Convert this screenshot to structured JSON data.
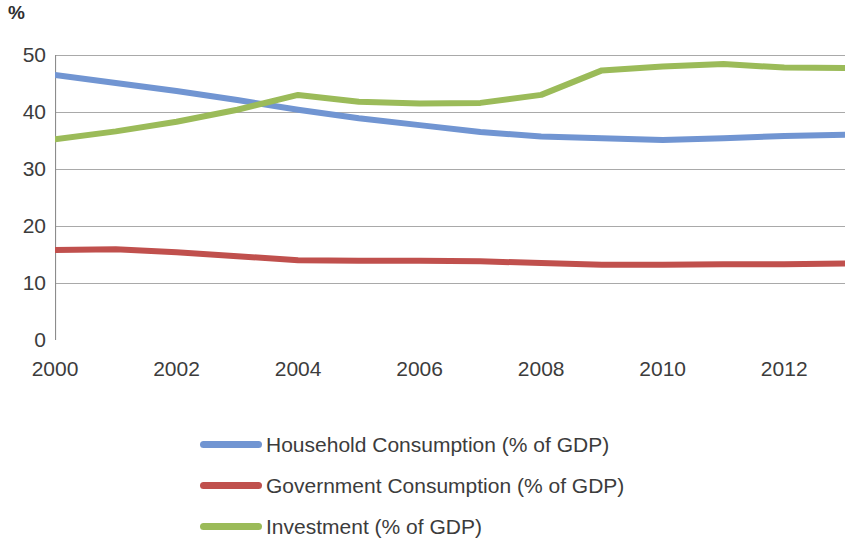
{
  "axis_unit_label": "%",
  "colors": {
    "household": "#7195D2",
    "government": "#C0504D",
    "investment": "#9BBB59",
    "gridline": "#9a9a9a",
    "axis": "#8c8c8c",
    "text": "#3c3c3c",
    "background": "#ffffff"
  },
  "legend": {
    "items": [
      {
        "label": "Household Consumption (% of GDP)",
        "color": "#7195D2",
        "key": "household"
      },
      {
        "label": "Government Consumption (% of GDP)",
        "color": "#C0504D",
        "key": "government"
      },
      {
        "label": "Investment (% of GDP)",
        "color": "#9BBB59",
        "key": "investment"
      }
    ]
  },
  "chart_data": {
    "type": "line",
    "title": "",
    "subtitle": "",
    "xlabel": "",
    "ylabel": "%",
    "xlim": [
      2000,
      2013
    ],
    "ylim": [
      0,
      50
    ],
    "ytick_labels": [
      "0",
      "10",
      "20",
      "30",
      "40",
      "50"
    ],
    "ytick_values": [
      0,
      10,
      20,
      30,
      40,
      50
    ],
    "xtick_labels": [
      "2000",
      "2002",
      "2004",
      "2006",
      "2008",
      "2010",
      "2012"
    ],
    "xtick_values": [
      2000,
      2002,
      2004,
      2006,
      2008,
      2010,
      2012
    ],
    "x_minor_ticks": [
      2000,
      2001,
      2002,
      2003,
      2004,
      2005,
      2006,
      2007,
      2008,
      2009,
      2010,
      2011,
      2012,
      2013
    ],
    "grid": "horizontal",
    "legend_position": "bottom",
    "x": [
      2000,
      2001,
      2002,
      2003,
      2004,
      2005,
      2006,
      2007,
      2008,
      2009,
      2010,
      2011,
      2012,
      2013
    ],
    "series": [
      {
        "name": "Household Consumption (% of GDP)",
        "color": "#7195D2",
        "values": [
          46.5,
          45.1,
          43.7,
          42.1,
          40.4,
          38.9,
          37.7,
          36.5,
          35.7,
          35.4,
          35.1,
          35.4,
          35.8,
          36.0
        ]
      },
      {
        "name": "Government Consumption (% of GDP)",
        "color": "#C0504D",
        "values": [
          15.8,
          15.9,
          15.4,
          14.7,
          14.0,
          13.9,
          13.9,
          13.8,
          13.5,
          13.2,
          13.2,
          13.3,
          13.3,
          13.4
        ]
      },
      {
        "name": "Investment (% of GDP)",
        "color": "#9BBB59",
        "values": [
          35.2,
          36.6,
          38.3,
          40.4,
          43.0,
          41.8,
          41.5,
          41.6,
          43.0,
          47.3,
          48.0,
          48.4,
          47.8,
          47.7
        ]
      }
    ]
  }
}
